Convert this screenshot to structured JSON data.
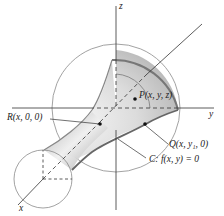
{
  "figure": {
    "type": "3d surface of revolution diagram",
    "axes": {
      "x": "x",
      "y": "y",
      "z": "z"
    },
    "labels": {
      "point_p": "P(x, y, z)",
      "point_r": "R(x, 0, 0)",
      "point_q": "Q(x, y₁, 0)",
      "curve_c": "C: f(x, y) = 0"
    },
    "colors": {
      "surface_light": "#f2f2f2",
      "surface_dark": "#9a9a9a",
      "line": "#333333",
      "circle": "#888888"
    }
  }
}
